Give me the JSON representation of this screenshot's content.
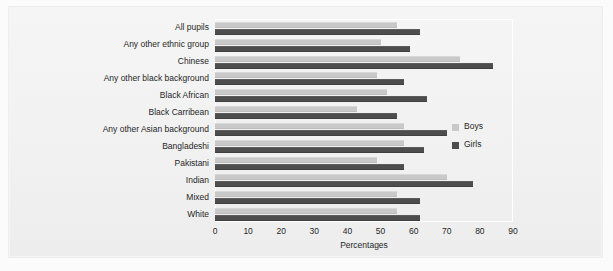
{
  "figure": {
    "background_color": "#f2f2f2",
    "plot_border_color": "#ffffff"
  },
  "chart_data": {
    "type": "bar",
    "orientation": "horizontal",
    "title": "",
    "subtitle": "",
    "xlabel": "Percentages",
    "ylabel": "",
    "xlim": [
      0,
      90
    ],
    "xticks": [
      0,
      10,
      20,
      30,
      40,
      50,
      60,
      70,
      80,
      90
    ],
    "xtick_labels": [
      "0",
      "10",
      "20",
      "30",
      "40",
      "50",
      "60",
      "70",
      "80",
      "90"
    ],
    "grid": false,
    "legend_position": "center right",
    "categories": [
      "All pupils",
      "Any other ethnic group",
      "Chinese",
      "Any other black background",
      "Black African",
      "Black Carribean",
      "Any other Asian background",
      "Bangladeshi",
      "Pakistani",
      "Indian",
      "Mixed",
      "White"
    ],
    "series": [
      {
        "name": "Boys",
        "color": "#c9c9c9",
        "values": [
          55,
          50,
          74,
          49,
          52,
          43,
          57,
          57,
          49,
          70,
          55,
          55
        ]
      },
      {
        "name": "Girls",
        "color": "#4d4d4d",
        "values": [
          62,
          59,
          84,
          57,
          64,
          55,
          70,
          63,
          57,
          78,
          62,
          62
        ]
      }
    ]
  }
}
